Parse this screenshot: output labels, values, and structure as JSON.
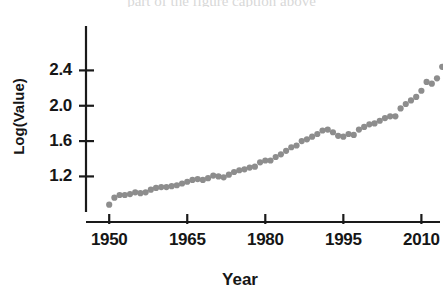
{
  "figure": {
    "clipped_header_text": "part of the figure caption above",
    "marker_color": "#8d8d8d",
    "axis_color": "#1a1a1a"
  },
  "chart_data": {
    "type": "scatter",
    "title": "",
    "xlabel": "Year",
    "ylabel": "Log(Value)",
    "xlim": [
      1949,
      2013
    ],
    "ylim": [
      0.82,
      2.88
    ],
    "xticks": [
      1950,
      1965,
      1980,
      1995,
      2010
    ],
    "xtick_labels": [
      "1950",
      "1965",
      "1980",
      "1995",
      "2010"
    ],
    "yticks": [
      1.2,
      1.6,
      2.0,
      2.4
    ],
    "ytick_labels": [
      "1.2",
      "1.6",
      "2.0",
      "2.4"
    ],
    "grid": false,
    "legend": "none",
    "marker": "circle",
    "series": [
      {
        "name": "Log(Value)",
        "color": "#8d8d8d",
        "x": [
          1950,
          1951,
          1952,
          1953,
          1954,
          1955,
          1956,
          1957,
          1958,
          1959,
          1960,
          1961,
          1962,
          1963,
          1964,
          1965,
          1966,
          1967,
          1968,
          1969,
          1970,
          1971,
          1972,
          1973,
          1974,
          1975,
          1976,
          1977,
          1978,
          1979,
          1980,
          1981,
          1982,
          1983,
          1984,
          1985,
          1986,
          1987,
          1988,
          1989,
          1990,
          1991,
          1992,
          1993,
          1994,
          1995,
          1996,
          1997,
          1998,
          1999,
          2000,
          2001,
          2002,
          2003,
          2004,
          2005,
          2006,
          2007,
          2008,
          2009,
          2010,
          2011,
          2012
        ],
        "y": [
          0.88,
          0.96,
          0.99,
          0.99,
          1.0,
          1.02,
          1.01,
          1.02,
          1.05,
          1.07,
          1.08,
          1.08,
          1.09,
          1.1,
          1.12,
          1.14,
          1.16,
          1.17,
          1.16,
          1.18,
          1.21,
          1.2,
          1.19,
          1.22,
          1.25,
          1.27,
          1.28,
          1.3,
          1.31,
          1.36,
          1.38,
          1.38,
          1.42,
          1.45,
          1.49,
          1.53,
          1.55,
          1.6,
          1.62,
          1.65,
          1.68,
          1.72,
          1.73,
          1.7,
          1.66,
          1.65,
          1.68,
          1.67,
          1.73,
          1.76,
          1.79,
          1.8,
          1.83,
          1.86,
          1.88,
          1.88,
          1.97,
          2.02,
          2.06,
          2.1,
          2.17,
          2.27,
          2.25
        ],
        "x_more": [
          2013,
          2014,
          2015,
          2016,
          2017,
          2018
        ],
        "y_more": [
          2.31,
          2.44,
          2.53,
          2.5,
          2.44,
          2.44
        ]
      }
    ],
    "notes": [
      "Steady upward log-linear growth from 1950 through 2012",
      "Local plateau / dip around 1982-1984",
      "Local peak around 2007 followed by a dip in 2008-2009",
      "Strong rise to the maximum at the right edge of the series"
    ]
  },
  "axis_geometry": {
    "y_axis_x": 86,
    "y_axis_top": 26,
    "y_axis_bottom": 212,
    "x_axis_y": 222,
    "x_axis_left": 86,
    "x_axis_right": 440,
    "px_per_year": 4.8,
    "px_per_unit_y": 82.5
  }
}
